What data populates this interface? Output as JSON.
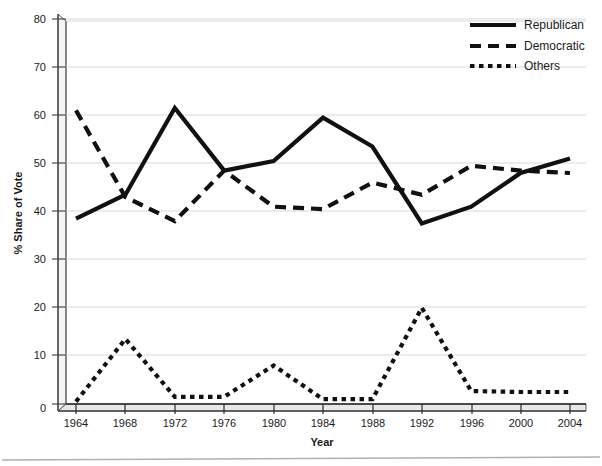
{
  "chart_data": {
    "type": "line",
    "title": "",
    "subtitle": "",
    "xlabel": "Year",
    "ylabel": "% Share of Vote",
    "x": [
      1964,
      1968,
      1972,
      1976,
      1980,
      1984,
      1988,
      1992,
      1996,
      2000,
      2004
    ],
    "categories": [
      "1964",
      "1968",
      "1972",
      "1976",
      "1980",
      "1984",
      "1988",
      "1992",
      "1996",
      "2000",
      "2004"
    ],
    "xlim": [
      1964,
      2004
    ],
    "ylim": [
      0,
      80
    ],
    "yticks": [
      0,
      10,
      20,
      30,
      40,
      50,
      60,
      70,
      80
    ],
    "ytick_labels": [
      "0",
      "10",
      "20",
      "30",
      "40",
      "50",
      "60",
      "70",
      "80"
    ],
    "grid": "horizontal",
    "legend_position": "top-right",
    "series": [
      {
        "name": "Republican",
        "style": "solid",
        "color": "#111111",
        "values": [
          38.5,
          43.5,
          61.5,
          48.5,
          50.5,
          59.5,
          53.5,
          37.5,
          41.0,
          48.0,
          51.0
        ]
      },
      {
        "name": "Democratic",
        "style": "dashed",
        "color": "#111111",
        "values": [
          61.0,
          43.0,
          38.0,
          48.5,
          41.0,
          40.5,
          46.0,
          43.5,
          49.5,
          48.5,
          48.0
        ]
      },
      {
        "name": "Others",
        "style": "dotted",
        "color": "#111111",
        "values": [
          0.5,
          13.5,
          1.5,
          1.5,
          8.0,
          1.0,
          1.0,
          20.0,
          2.7,
          2.5,
          2.5
        ]
      }
    ]
  },
  "axes": {
    "y_title": "% Share of Vote",
    "x_title": "Year",
    "y_ticks": [
      "80",
      "70",
      "60",
      "50",
      "40",
      "30",
      "20",
      "10",
      "0"
    ],
    "x_ticks": [
      "1964",
      "1968",
      "1972",
      "1976",
      "1980",
      "1984",
      "1988",
      "1992",
      "1996",
      "2000",
      "2004"
    ]
  },
  "legend": {
    "items": [
      {
        "label": "Republican",
        "style": "solid"
      },
      {
        "label": "Democratic",
        "style": "dashed"
      },
      {
        "label": "Others",
        "style": "dotted"
      }
    ]
  },
  "colors": {
    "line": "#111111",
    "grid": "#d8d8d8",
    "axis": "#4a4a4a",
    "background": "#ffffff",
    "rule": "#b0b0b0"
  }
}
